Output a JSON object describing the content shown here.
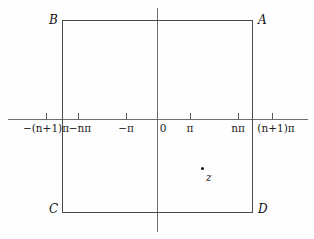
{
  "figure": {
    "background_color": "#fefefe",
    "line_color": "#4a4a4a",
    "axis_color": "#6e6e6e",
    "text_color": "#111111"
  },
  "axes": {
    "horizontal": {
      "name": "real-axis",
      "label": ""
    },
    "vertical": {
      "name": "imaginary-axis",
      "label": ""
    },
    "origin_label": "0"
  },
  "ticks": [
    {
      "id": "neg-n-plus-1-pi",
      "label": "−(n+1)π",
      "x": 46
    },
    {
      "id": "neg-n-pi",
      "label": "−nπ",
      "x": 78
    },
    {
      "id": "neg-pi",
      "label": "−π",
      "x": 126
    },
    {
      "id": "origin",
      "label": "0",
      "x": 163
    },
    {
      "id": "pi",
      "label": "π",
      "x": 190
    },
    {
      "id": "n-pi",
      "label": "nπ",
      "x": 238
    },
    {
      "id": "n-plus-1-pi",
      "label": "(n+1)π",
      "x": 272
    }
  ],
  "rectangle": {
    "name": "contour-rectangle",
    "vertices": [
      {
        "id": "A",
        "label": "A",
        "position": "top-right"
      },
      {
        "id": "B",
        "label": "B",
        "position": "top-left"
      },
      {
        "id": "C",
        "label": "C",
        "position": "bottom-left"
      },
      {
        "id": "D",
        "label": "D",
        "position": "bottom-right"
      }
    ]
  },
  "point": {
    "name": "point-z",
    "label": "z",
    "description": "interior point inside rectangle, lower-right quadrant"
  }
}
